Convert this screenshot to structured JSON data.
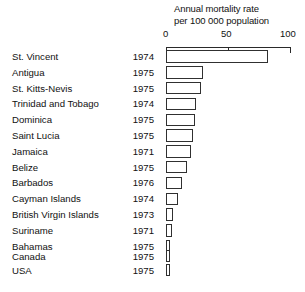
{
  "chart_data": {
    "type": "bar",
    "orientation": "horizontal",
    "title": "Annual mortality rate per 100 000 population",
    "title_lines": [
      "Annual mortality rate",
      "per 100 000 population"
    ],
    "xlabel": "",
    "ylabel": "",
    "xlim": [
      0,
      100
    ],
    "ticks": [
      0,
      50,
      100
    ],
    "tick_labels": [
      "0",
      "50",
      "100"
    ],
    "grid": false,
    "legend": null,
    "categories": [
      "St. Vincent",
      "Antigua",
      "St. Kitts-Nevis",
      "Trinidad and Tobago",
      "Dominica",
      "Saint Lucia",
      "Jamaica",
      "Belize",
      "Barbados",
      "Cayman Islands",
      "British Virgin Islands",
      "Suriname",
      "Bahamas",
      "Canada",
      "USA"
    ],
    "years": [
      "1974",
      "1975",
      "1975",
      "1974",
      "1975",
      "1975",
      "1971",
      "1975",
      "1976",
      "1974",
      "1973",
      "1971",
      "1975",
      "1975",
      "1975"
    ],
    "values": [
      82,
      30,
      28,
      24,
      23,
      22,
      20,
      17,
      13,
      10,
      6,
      5,
      3,
      3,
      3
    ],
    "groups": [
      {
        "name": "caribbean",
        "rows": [
          {
            "country": "St. Vincent",
            "year": "1974",
            "value": 82
          },
          {
            "country": "Antigua",
            "year": "1975",
            "value": 30
          },
          {
            "country": "St. Kitts-Nevis",
            "year": "1975",
            "value": 28
          },
          {
            "country": "Trinidad and Tobago",
            "year": "1974",
            "value": 24
          },
          {
            "country": "Dominica",
            "year": "1975",
            "value": 23
          },
          {
            "country": "Saint Lucia",
            "year": "1975",
            "value": 22
          },
          {
            "country": "Jamaica",
            "year": "1971",
            "value": 20
          },
          {
            "country": "Belize",
            "year": "1975",
            "value": 17
          },
          {
            "country": "Barbados",
            "year": "1976",
            "value": 13
          },
          {
            "country": "Cayman Islands",
            "year": "1974",
            "value": 10
          },
          {
            "country": "British Virgin Islands",
            "year": "1973",
            "value": 6
          },
          {
            "country": "Suriname",
            "year": "1971",
            "value": 5
          },
          {
            "country": "Bahamas",
            "year": "1975",
            "value": 3
          }
        ]
      },
      {
        "name": "north-america",
        "rows": [
          {
            "country": "Canada",
            "year": "1975",
            "value": 3
          },
          {
            "country": "USA",
            "year": "1975",
            "value": 3
          }
        ]
      }
    ],
    "colors": {
      "bar_fill": "#ffffff",
      "bar_stroke": "#303030",
      "axis": "#2a2a2a",
      "text": "#111111",
      "background": "#ffffff"
    }
  }
}
